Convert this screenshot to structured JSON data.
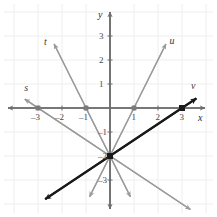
{
  "figure": {
    "title": "",
    "background_color": "#ffffff",
    "grid_color": "#eeeeee",
    "axis_color": "#6e6e6e",
    "gray_line_color": "#9a9a9a",
    "black_line_color": "#1a1a1a"
  },
  "axes": {
    "x_label": "x",
    "y_label": "y",
    "xlim": [
      -3.9,
      3.9
    ],
    "ylim": [
      -3.9,
      3.9
    ],
    "x_ticks": [
      {
        "value": -3,
        "label": "–3"
      },
      {
        "value": -2,
        "label": "–2"
      },
      {
        "value": -1,
        "label": "–1"
      },
      {
        "value": 1,
        "label": "1"
      },
      {
        "value": 2,
        "label": "2"
      },
      {
        "value": 3,
        "label": "3"
      }
    ],
    "y_ticks": [
      {
        "value": 3,
        "label": "3"
      },
      {
        "value": 2,
        "label": "2"
      },
      {
        "value": 1,
        "label": "1"
      },
      {
        "value": -1,
        "label": "–1"
      },
      {
        "value": -2,
        "label": "–2"
      },
      {
        "value": -3,
        "label": "–3"
      }
    ]
  },
  "chart_data": {
    "type": "line",
    "title": "",
    "xlabel": "x",
    "ylabel": "y",
    "xlim": [
      -3.9,
      3.9
    ],
    "ylim": [
      -3.9,
      3.9
    ],
    "grid": true,
    "legend": "inline-endpoint-labels",
    "common_point": {
      "x": 0,
      "y": -2
    },
    "series": [
      {
        "name": "s",
        "label": "s",
        "color": "#9a9a9a",
        "style": "solid",
        "weight": "normal",
        "x_intercept": -3,
        "y_intercept": -2,
        "slope": -0.6667,
        "points": [
          {
            "x": -3,
            "y": 0
          },
          {
            "x": 0,
            "y": -2
          }
        ],
        "draw_from": {
          "x": -3.55,
          "y": 0.37
        },
        "draw_to": {
          "x": 3.35,
          "y": -4.23
        },
        "arrows": "both",
        "label_pos": {
          "x": -3.45,
          "y": 0.85
        }
      },
      {
        "name": "t",
        "label": "t",
        "color": "#9a9a9a",
        "style": "solid",
        "weight": "normal",
        "x_intercept": -1,
        "y_intercept": -2,
        "slope": -2,
        "points": [
          {
            "x": -1,
            "y": 0
          },
          {
            "x": 0,
            "y": -2
          }
        ],
        "draw_from": {
          "x": -2.33,
          "y": 2.67
        },
        "draw_to": {
          "x": 0.85,
          "y": -3.7
        },
        "arrows": "both",
        "label_pos": {
          "x": -2.62,
          "y": 2.75
        }
      },
      {
        "name": "u",
        "label": "u",
        "color": "#9a9a9a",
        "style": "solid",
        "weight": "normal",
        "x_intercept": 1,
        "y_intercept": -2,
        "slope": 2,
        "points": [
          {
            "x": 1,
            "y": 0
          },
          {
            "x": 0,
            "y": -2
          }
        ],
        "draw_from": {
          "x": 2.33,
          "y": 2.67
        },
        "draw_to": {
          "x": -0.85,
          "y": -3.7
        },
        "arrows": "both",
        "label_pos": {
          "x": 2.6,
          "y": 2.8
        }
      },
      {
        "name": "v",
        "label": "v",
        "color": "#1a1a1a",
        "style": "solid",
        "weight": "bold",
        "x_intercept": 3,
        "y_intercept": -2,
        "slope": 0.6667,
        "points": [
          {
            "x": 3,
            "y": 0
          },
          {
            "x": 0,
            "y": -2
          }
        ],
        "draw_from": {
          "x": 3.6,
          "y": 0.4
        },
        "draw_to": {
          "x": -2.7,
          "y": -3.8
        },
        "arrows": "both",
        "label_pos": {
          "x": 3.5,
          "y": 0.9
        }
      }
    ],
    "marked_points": [
      {
        "x": -3,
        "y": 0,
        "series": "s",
        "color": "#7a7a7a"
      },
      {
        "x": -1,
        "y": 0,
        "series": "t",
        "color": "#7a7a7a"
      },
      {
        "x": 1,
        "y": 0,
        "series": "u",
        "color": "#7a7a7a"
      },
      {
        "x": 3,
        "y": 0,
        "series": "v",
        "color": "#1a1a1a"
      },
      {
        "x": 0,
        "y": -2,
        "series": "all",
        "color": "#1a1a1a"
      }
    ]
  }
}
